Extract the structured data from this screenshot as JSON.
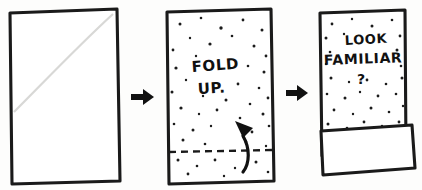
{
  "diagram": {
    "ink_color": "#1a1a1a",
    "paper_color": "#ffffff",
    "background_color": "#fdfdfc"
  },
  "panels": [
    {
      "id": "panel-1",
      "name": "blank-sheet",
      "caption": "",
      "has_speckles": false,
      "has_fold_line": false,
      "has_flap": false
    },
    {
      "id": "panel-2",
      "name": "speckled-sheet-fold-up",
      "text_lines": [
        "FOLD",
        "UP."
      ],
      "has_speckles": true,
      "has_fold_line": true,
      "has_flap": false,
      "fold_instruction": "FOLD UP."
    },
    {
      "id": "panel-3",
      "name": "folded-sheet-look-familiar",
      "text_lines": [
        "LOOK",
        "FAMILIAR",
        "?"
      ],
      "has_speckles": true,
      "has_fold_line": false,
      "has_flap": true,
      "question": "LOOK FAMILIAR ?"
    }
  ],
  "arrows": [
    {
      "id": "arrow-1",
      "name": "step-arrow-one-to-two",
      "direction": "right",
      "glyph": "right-arrow"
    },
    {
      "id": "arrow-2",
      "name": "step-arrow-two-to-three",
      "direction": "right",
      "glyph": "right-arrow"
    },
    {
      "id": "arrow-fold",
      "name": "curved-fold-up-arrow",
      "direction": "up",
      "glyph": "curved-up-arrow"
    }
  ],
  "labels": {
    "panel2_line1": "FOLD",
    "panel2_line2": "UP.",
    "panel3_line1": "LOOK",
    "panel3_line2": "FAMILIAR",
    "panel3_line3": "?"
  }
}
